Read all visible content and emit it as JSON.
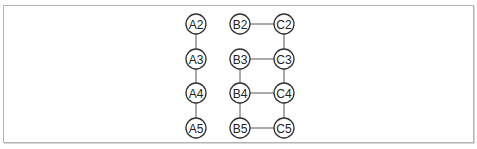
{
  "diagram": {
    "node_radius": 10,
    "nodes": [
      {
        "id": "A2",
        "label": "A2",
        "x": 196,
        "y": 24
      },
      {
        "id": "A3",
        "label": "A3",
        "x": 196,
        "y": 59
      },
      {
        "id": "A4",
        "label": "A4",
        "x": 196,
        "y": 93
      },
      {
        "id": "A5",
        "label": "A5",
        "x": 196,
        "y": 128
      },
      {
        "id": "B2",
        "label": "B2",
        "x": 240,
        "y": 24
      },
      {
        "id": "B3",
        "label": "B3",
        "x": 240,
        "y": 59
      },
      {
        "id": "B4",
        "label": "B4",
        "x": 240,
        "y": 93
      },
      {
        "id": "B5",
        "label": "B5",
        "x": 240,
        "y": 128
      },
      {
        "id": "C2",
        "label": "C2",
        "x": 284,
        "y": 24
      },
      {
        "id": "C3",
        "label": "C3",
        "x": 284,
        "y": 59
      },
      {
        "id": "C4",
        "label": "C4",
        "x": 284,
        "y": 93
      },
      {
        "id": "C5",
        "label": "C5",
        "x": 284,
        "y": 128
      }
    ],
    "edges": [
      [
        "A2",
        "A3"
      ],
      [
        "A3",
        "A4"
      ],
      [
        "A4",
        "A5"
      ],
      [
        "B2",
        "C2"
      ],
      [
        "B3",
        "C3"
      ],
      [
        "B4",
        "C4"
      ],
      [
        "B5",
        "C5"
      ],
      [
        "C2",
        "C3"
      ],
      [
        "C3",
        "C4"
      ],
      [
        "C4",
        "C5"
      ],
      [
        "B3",
        "B4"
      ],
      [
        "B4",
        "B5"
      ]
    ]
  }
}
